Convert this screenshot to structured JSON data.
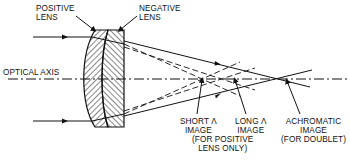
{
  "colors": {
    "line": "#111111",
    "background": "#ffffff"
  },
  "labels": {
    "positive_lens": [
      "POSITIVE",
      "LENS"
    ],
    "negative_lens": [
      "NEGATIVE",
      "LENS"
    ],
    "optical_axis": "OPTICAL AXIS",
    "short_image": [
      "SHORT λ",
      "IMAGE"
    ],
    "short_note": [
      "(FOR POSITIVE",
      "LENS ONLY)"
    ],
    "long_image": [
      "LONG λ",
      "IMAGE"
    ],
    "achromatic_image": [
      "ACHROMATIC",
      "IMAGE",
      "(FOR DOUBLET)"
    ]
  }
}
